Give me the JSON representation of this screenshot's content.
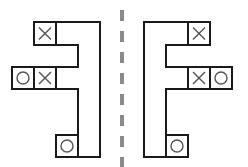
{
  "diagram": {
    "colors": {
      "outline": "#1a1a1a",
      "mark": "#555555",
      "axis": "#8a8a8a",
      "background": "#ffffff"
    },
    "left_figure": {
      "cells": [
        {
          "position": "top",
          "mark": "X"
        },
        {
          "position": "middle-outer",
          "mark": "O"
        },
        {
          "position": "middle-inner",
          "mark": "X"
        },
        {
          "position": "bottom",
          "mark": "O"
        }
      ]
    },
    "right_figure": {
      "cells": [
        {
          "position": "top",
          "mark": "X"
        },
        {
          "position": "middle-inner",
          "mark": "X"
        },
        {
          "position": "middle-outer",
          "mark": "O"
        },
        {
          "position": "bottom",
          "mark": "O"
        }
      ]
    },
    "axis": {
      "style": "dashed",
      "orientation": "vertical"
    }
  }
}
